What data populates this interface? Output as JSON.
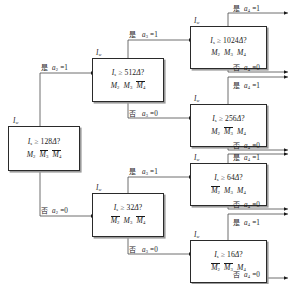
{
  "diagram": {
    "type": "binary-decision-tree",
    "language": "zh-CN",
    "signal_label": "Iw",
    "labels": {
      "yes": "是",
      "no": "否"
    },
    "nodes": [
      {
        "id": "n128",
        "level": 1,
        "top_label": "Iw",
        "condition": "Is ≥ 128Δ?",
        "threshold": 128,
        "masks": [
          "M2",
          "M3̅",
          "M4̅"
        ]
      },
      {
        "id": "n512",
        "level": 2,
        "top_label": "Iw",
        "condition": "Is ≥ 512Δ?",
        "threshold": 512,
        "masks": [
          "M2",
          "M3",
          "M4̅"
        ]
      },
      {
        "id": "n32",
        "level": 2,
        "top_label": "Iw",
        "condition": "Is ≥ 32Δ?",
        "threshold": 32,
        "masks": [
          "M2̅",
          "M3",
          "M4̅"
        ]
      },
      {
        "id": "n1024",
        "level": 3,
        "top_label": "Iw",
        "condition": "Is ≥ 1024Δ?",
        "threshold": 1024,
        "masks": [
          "M2",
          "M3",
          "M4"
        ]
      },
      {
        "id": "n256",
        "level": 3,
        "top_label": "Iw",
        "condition": "Is ≥ 256Δ?",
        "threshold": 256,
        "masks": [
          "M2",
          "M3̅",
          "M4"
        ]
      },
      {
        "id": "n64",
        "level": 3,
        "top_label": "Iw",
        "condition": "Is ≥ 64Δ?",
        "threshold": 64,
        "masks": [
          "M2̅",
          "M3",
          "M4"
        ]
      },
      {
        "id": "n16",
        "level": 3,
        "top_label": "Iw",
        "condition": "Is ≥ 16Δ?",
        "threshold": 16,
        "masks": [
          "M2̅",
          "M3̅",
          "M4"
        ]
      }
    ],
    "edges": [
      {
        "id": "e-a2-yes",
        "from": "n128",
        "to": "n512",
        "branch": "yes",
        "label_cjk": "是",
        "label_expr": "a2 = 1"
      },
      {
        "id": "e-a2-no",
        "from": "n128",
        "to": "n32",
        "branch": "no",
        "label_cjk": "否",
        "label_expr": "a2 = 0"
      },
      {
        "id": "e-a3-yes-top",
        "from": "n512",
        "to": "n1024",
        "branch": "yes",
        "label_cjk": "是",
        "label_expr": "a3 = 1"
      },
      {
        "id": "e-a3-no-top",
        "from": "n512",
        "to": "n256",
        "branch": "no",
        "label_cjk": "否",
        "label_expr": "a3 = 0"
      },
      {
        "id": "e-a3-yes-bot",
        "from": "n32",
        "to": "n64",
        "branch": "yes",
        "label_cjk": "是",
        "label_expr": "a3 = 1"
      },
      {
        "id": "e-a3-no-bot",
        "from": "n32",
        "to": "n16",
        "branch": "no",
        "label_cjk": "否",
        "label_expr": "a3 = 0"
      },
      {
        "id": "e-a4-yes-1024",
        "from": "n1024",
        "to": "out",
        "branch": "yes",
        "label_cjk": "是",
        "label_expr": "a4 = 1"
      },
      {
        "id": "e-a4-no-1024",
        "from": "n1024",
        "to": "out",
        "branch": "no",
        "label_cjk": "否",
        "label_expr": "a4 = 0"
      },
      {
        "id": "e-a4-yes-256",
        "from": "n256",
        "to": "out",
        "branch": "yes",
        "label_cjk": "是",
        "label_expr": "a4 = 1"
      },
      {
        "id": "e-a4-no-256",
        "from": "n256",
        "to": "out",
        "branch": "no",
        "label_cjk": "否",
        "label_expr": "a4 = 0"
      },
      {
        "id": "e-a4-yes-64",
        "from": "n64",
        "to": "out",
        "branch": "yes",
        "label_cjk": "是",
        "label_expr": "a4 = 1"
      },
      {
        "id": "e-a4-no-64",
        "from": "n64",
        "to": "out",
        "branch": "no",
        "label_cjk": "否",
        "label_expr": "a4 = 0"
      },
      {
        "id": "e-a4-yes-16",
        "from": "n16",
        "to": "out",
        "branch": "yes",
        "label_cjk": "是",
        "label_expr": "a4 = 1"
      },
      {
        "id": "e-a4-no-16",
        "from": "n16",
        "to": "out",
        "branch": "no",
        "label_cjk": "否",
        "label_expr": "a4 = 0"
      }
    ],
    "colors": {
      "stroke": "#2a2a2a",
      "box_fill": "#ffffff",
      "shadow": "#9a9a9a",
      "background": "#ffffff"
    }
  }
}
